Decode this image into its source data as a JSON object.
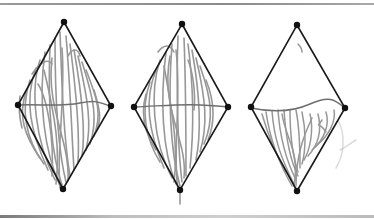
{
  "figure": {
    "stroke_color": "#1a1a1a",
    "scribble_color": "#8c8c8c",
    "midline_color": "#6e6e6e",
    "panels": [
      {
        "id": "left",
        "vertices": {
          "top": [
            64,
            22
          ],
          "left": [
            18,
            105
          ],
          "right": [
            111,
            106
          ],
          "bottom": [
            63,
            189
          ]
        },
        "fill": "full"
      },
      {
        "id": "middle",
        "vertices": {
          "top": [
            182,
            24
          ],
          "left": [
            134,
            107
          ],
          "right": [
            228,
            107
          ],
          "bottom": [
            180,
            190
          ]
        },
        "fill": "full"
      },
      {
        "id": "right",
        "vertices": {
          "top": [
            297,
            25
          ],
          "left": [
            251,
            107
          ],
          "right": [
            345,
            108
          ],
          "bottom": [
            297,
            191
          ]
        },
        "fill": "lower-half"
      }
    ]
  }
}
